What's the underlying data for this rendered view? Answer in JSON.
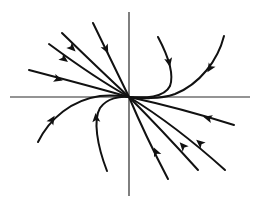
{
  "diagram": {
    "type": "phase-portrait",
    "colors": {
      "background": "#ffffff",
      "stroke": "#111111",
      "axis": "#2a2a2a"
    },
    "origin": [
      129,
      97
    ],
    "axes": {
      "x": {
        "from": [
          10,
          97
        ],
        "to": [
          250,
          97
        ]
      },
      "y": {
        "from": [
          129,
          12
        ],
        "to": [
          129,
          196
        ]
      }
    },
    "trajectories": [
      {
        "id": "tl-1",
        "path": "M29,70 Q90,86 129,97",
        "arrow": {
          "at": [
            58,
            79
          ],
          "angle": 16
        }
      },
      {
        "id": "tl-2",
        "path": "M49,44 Q95,78 129,97",
        "arrow": {
          "at": [
            64,
            59
          ],
          "angle": 37
        }
      },
      {
        "id": "tl-3",
        "path": "M62,33 Q100,70 129,97",
        "arrow": {
          "at": [
            72,
            48
          ],
          "angle": 44
        }
      },
      {
        "id": "tl-4",
        "path": "M93,23 Q112,62 129,97",
        "arrow": {
          "at": [
            106,
            49
          ],
          "angle": 63
        }
      },
      {
        "id": "tr-1",
        "path": "M158,37 C166,52 175,72 170,86 C164,98 145,98 129,97",
        "arrow": {
          "at": [
            169,
            62
          ],
          "angle": 78
        }
      },
      {
        "id": "tr-2",
        "path": "M224,36 C218,60 200,84 175,94 C158,100 140,98 129,97",
        "arrow": {
          "at": [
            210,
            68
          ],
          "angle": 122
        }
      },
      {
        "id": "bl-1",
        "path": "M38,142 C50,118 72,100 100,96 C112,95 122,96 129,97",
        "arrow": {
          "at": [
            52,
            120
          ],
          "angle": -58
        }
      },
      {
        "id": "bl-2",
        "path": "M107,171 C97,145 93,120 100,108 C107,98 120,96 129,97",
        "arrow": {
          "at": [
            96,
            118
          ],
          "angle": -95
        }
      },
      {
        "id": "br-1",
        "path": "M234,125 Q180,108 129,97",
        "arrow": {
          "at": [
            208,
            118
          ],
          "angle": 195
        }
      },
      {
        "id": "br-2",
        "path": "M225,170 Q175,125 129,97",
        "arrow": {
          "at": [
            200,
            143
          ],
          "angle": 220
        }
      },
      {
        "id": "br-3",
        "path": "M198,170 Q160,128 129,97",
        "arrow": {
          "at": [
            183,
            146
          ],
          "angle": 228
        }
      },
      {
        "id": "br-4",
        "path": "M168,179 Q145,135 129,97",
        "arrow": {
          "at": [
            156,
            152
          ],
          "angle": 245
        }
      }
    ]
  }
}
